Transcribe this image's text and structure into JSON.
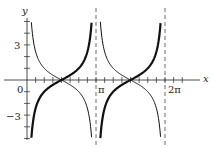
{
  "chart_data": {
    "type": "line",
    "title": "",
    "xlabel": "x",
    "ylabel": "y",
    "xlim": [
      -0.35,
      7.9
    ],
    "ylim": [
      -5.8,
      6.3
    ],
    "x_ticks": {
      "step_rad": 0.3927,
      "labels": [
        {
          "value": 3.1416,
          "text": "π"
        },
        {
          "value": 6.2832,
          "text": "2π"
        }
      ]
    },
    "y_ticks": {
      "step": 1,
      "labels": [
        {
          "value": 0,
          "text": "0"
        },
        {
          "value": 3,
          "text": "3"
        },
        {
          "value": -3,
          "text": "−3"
        }
      ]
    },
    "asymptotes": [
      3.1416,
      6.2832
    ],
    "grid": false,
    "series": [
      {
        "name": "y = −cot x",
        "style": "thick",
        "function": "-cot(x)",
        "domain": [
          [
            0.2,
            2.94
          ],
          [
            3.34,
            6.08
          ]
        ]
      },
      {
        "name": "y = cot x",
        "style": "thin",
        "function": "cot(x)",
        "domain": [
          [
            0.2,
            2.94
          ],
          [
            3.34,
            6.08
          ]
        ]
      }
    ]
  },
  "labels": {
    "x_axis": "x",
    "y_axis": "y",
    "origin": "0",
    "y_pos": "3",
    "y_neg": "−3",
    "pi": "π",
    "two_pi": "2π"
  }
}
